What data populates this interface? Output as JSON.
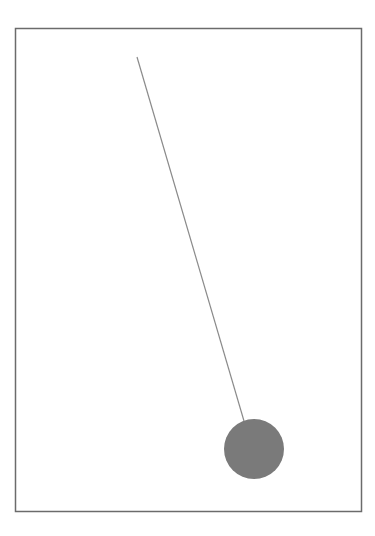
{
  "diagram": {
    "type": "pendulum",
    "frame": {
      "x": 15.5,
      "y": 28.5,
      "width": 346,
      "height": 483,
      "stroke": "#6b6b6b",
      "stroke_width": 1.5
    },
    "pivot": {
      "x": 137,
      "y": 57
    },
    "string": {
      "x2": 244,
      "y2": 421,
      "stroke": "#8a8a8a",
      "stroke_width": 1.2
    },
    "bob": {
      "cx": 254,
      "cy": 449,
      "r": 30,
      "fill": "#7a7a7a"
    }
  }
}
